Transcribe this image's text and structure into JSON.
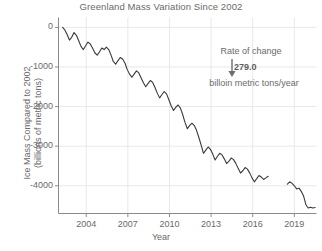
{
  "chart_data": {
    "type": "line",
    "title": "Greenland Mass Variation Since 2002",
    "xlabel": "Year",
    "ylabel": "Ice Mass Compared to 2002\n(billions of metric tons)",
    "ylabel_line1": "Ice Mass Compared to 2002",
    "ylabel_line2": "(billions of metric tons)",
    "xlim": [
      2002.0,
      2020.6
    ],
    "ylim": [
      -4700,
      250
    ],
    "grid": true,
    "legend": "none",
    "xticks": [
      2004,
      2007,
      2010,
      2013,
      2016,
      2019
    ],
    "xticklabels": [
      "2004",
      "2007",
      "2010",
      "2013",
      "2016",
      "2019"
    ],
    "yticks": [
      0,
      -1000,
      -2000,
      -3000,
      -4000
    ],
    "yticklabels": [
      "0",
      "-1000",
      "-2000",
      "-3000",
      "-4000"
    ],
    "line_color": "#3a3a3a",
    "grid_color": "#e8e8e8",
    "axis_color": "#8a8a8a",
    "annotations": [
      {
        "name": "rate-of-change",
        "label": "Rate of change",
        "value": "279.0",
        "units": "billoin metric tons/year",
        "arrow": "down"
      }
    ],
    "series": [
      {
        "name": "Greenland ice mass anomaly",
        "units": "billions of metric tons",
        "gap_after_x": 2017.2,
        "gap_before_x": 2018.45,
        "x": [
          2002.3,
          2002.45,
          2002.62,
          2002.79,
          2002.95,
          2003.12,
          2003.29,
          2003.45,
          2003.62,
          2003.79,
          2003.95,
          2004.12,
          2004.29,
          2004.45,
          2004.62,
          2004.79,
          2004.95,
          2005.12,
          2005.29,
          2005.45,
          2005.62,
          2005.79,
          2005.95,
          2006.12,
          2006.29,
          2006.45,
          2006.62,
          2006.79,
          2006.95,
          2007.12,
          2007.29,
          2007.45,
          2007.62,
          2007.79,
          2007.95,
          2008.12,
          2008.29,
          2008.45,
          2008.62,
          2008.79,
          2008.95,
          2009.12,
          2009.29,
          2009.45,
          2009.62,
          2009.79,
          2009.95,
          2010.12,
          2010.29,
          2010.45,
          2010.62,
          2010.79,
          2010.95,
          2011.12,
          2011.29,
          2011.45,
          2011.62,
          2011.79,
          2011.95,
          2012.12,
          2012.29,
          2012.45,
          2012.62,
          2012.79,
          2012.95,
          2013.12,
          2013.29,
          2013.45,
          2013.62,
          2013.79,
          2013.95,
          2014.12,
          2014.29,
          2014.45,
          2014.62,
          2014.79,
          2014.95,
          2015.12,
          2015.29,
          2015.45,
          2015.62,
          2015.79,
          2015.95,
          2016.12,
          2016.29,
          2016.45,
          2016.62,
          2016.79,
          2016.95,
          2017.12,
          2018.5,
          2018.67,
          2018.84,
          2019.0,
          2019.17,
          2019.34,
          2019.5,
          2019.67,
          2019.84,
          2020.0,
          2020.17,
          2020.34,
          2020.5
        ],
        "y": [
          0,
          -60,
          -180,
          -320,
          -250,
          -130,
          -200,
          -330,
          -480,
          -560,
          -470,
          -370,
          -420,
          -520,
          -640,
          -700,
          -620,
          -520,
          -560,
          -500,
          -560,
          -700,
          -860,
          -930,
          -840,
          -760,
          -800,
          -900,
          -1060,
          -1180,
          -1260,
          -1180,
          -1100,
          -1150,
          -1270,
          -1400,
          -1500,
          -1420,
          -1340,
          -1390,
          -1510,
          -1660,
          -1780,
          -1700,
          -1620,
          -1680,
          -1820,
          -1980,
          -2100,
          -2020,
          -1960,
          -2040,
          -2200,
          -2400,
          -2560,
          -2480,
          -2420,
          -2480,
          -2600,
          -2780,
          -2980,
          -3180,
          -3100,
          -3020,
          -3080,
          -3200,
          -3350,
          -3260,
          -3180,
          -3220,
          -3320,
          -3440,
          -3380,
          -3300,
          -3340,
          -3440,
          -3560,
          -3680,
          -3620,
          -3540,
          -3580,
          -3680,
          -3800,
          -3900,
          -3820,
          -3740,
          -3780,
          -3840,
          -3800,
          -3760,
          -3960,
          -3900,
          -3940,
          -4000,
          -4080,
          -4060,
          -4140,
          -4260,
          -4480,
          -4560,
          -4540,
          -4560,
          -4550
        ]
      }
    ]
  }
}
